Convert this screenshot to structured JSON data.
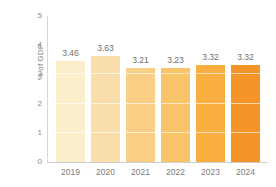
{
  "chart_data": {
    "type": "bar",
    "title": "",
    "subtitle": "",
    "xlabel": "",
    "ylabel": "% of GDP",
    "categories": [
      "2019",
      "2020",
      "2021",
      "2022",
      "2023",
      "2024"
    ],
    "values": [
      3.46,
      3.63,
      3.21,
      3.23,
      3.32,
      3.32
    ],
    "data_labels": [
      "3.46",
      "3.63",
      "3.21",
      "3.23",
      "3.32",
      "3.32"
    ],
    "ylim": [
      0,
      5
    ],
    "ytick_labels": [
      "0",
      "1",
      "2",
      "3",
      "4",
      "5"
    ],
    "ytick_values": [
      0,
      1,
      2,
      3,
      4,
      5
    ],
    "grid": "horizontal-white-inside-bars",
    "legend": "none",
    "bar_colors": [
      "#fbeecb",
      "#f9ddab",
      "#f9cf86",
      "#fac36a",
      "#f8ae40",
      "#f59426"
    ],
    "axis_color": "#d2d2d2",
    "label_color": "#7c7c7c",
    "background": "#ffffff"
  }
}
